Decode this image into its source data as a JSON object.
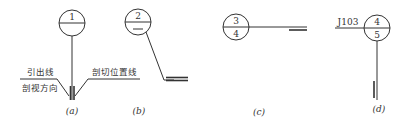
{
  "diagram": {
    "type": "section-index-symbols",
    "panels": [
      {
        "id": "a",
        "caption": "(a)",
        "circle_top": "1",
        "circle_bottom": "",
        "labels": {
          "leader_line": "引出线",
          "view_direction": "剖视方向",
          "cut_position_line": "剖切位置线"
        }
      },
      {
        "id": "b",
        "caption": "(b)",
        "circle_top": "2",
        "circle_bottom": "—"
      },
      {
        "id": "c",
        "caption": "(c)",
        "circle_top": "3",
        "circle_bottom": "4"
      },
      {
        "id": "d",
        "caption": "(d)",
        "circle_top": "4",
        "circle_bottom": "5",
        "drawing_code": "J103"
      }
    ],
    "colors": {
      "line": "#333333",
      "background": "#ffffff"
    }
  }
}
